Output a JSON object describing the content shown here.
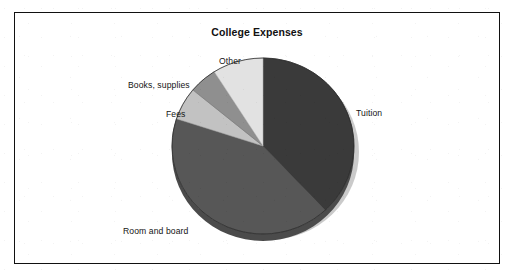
{
  "page": {
    "top_cut_text": "",
    "background_color": "#ffffff",
    "frame_border_color": "#111111"
  },
  "chart_data": {
    "type": "pie",
    "title": "College Expenses",
    "subtitle": "",
    "xlabel": "",
    "ylabel": "",
    "legend_position": "none",
    "labels_position": "outside",
    "style": "3d-pie-with-shadow",
    "start_angle_deg": 0,
    "direction": "clockwise",
    "categories": [
      "Tuition",
      "Room and board",
      "Fees",
      "Books, supplies",
      "Other"
    ],
    "values": [
      38,
      42,
      6,
      5,
      9
    ],
    "value_unit": "percent",
    "colors": [
      "#3a3a3a",
      "#575757",
      "#c2c2c2",
      "#8f8f8f",
      "#e2e2e2"
    ],
    "slices": [
      {
        "label": "Tuition",
        "value": 38,
        "color": "#3a3a3a",
        "start_deg": 0,
        "end_deg": 137
      },
      {
        "label": "Room and board",
        "value": 42,
        "color": "#575757",
        "start_deg": 137,
        "end_deg": 288
      },
      {
        "label": "Fees",
        "value": 6,
        "color": "#c2c2c2",
        "start_deg": 288,
        "end_deg": 310
      },
      {
        "label": "Books, supplies",
        "value": 5,
        "color": "#8f8f8f",
        "start_deg": 310,
        "end_deg": 328
      },
      {
        "label": "Other",
        "value": 9,
        "color": "#e2e2e2",
        "start_deg": 328,
        "end_deg": 360
      }
    ]
  },
  "labels": {
    "tuition": "Tuition",
    "room_and_board": "Room and board",
    "fees": "Fees",
    "books_supplies": "Books, supplies",
    "other": "Other"
  }
}
